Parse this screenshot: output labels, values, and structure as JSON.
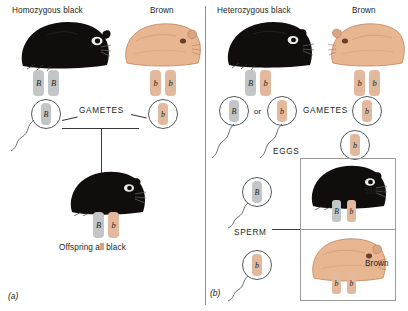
{
  "figure": {
    "panels": [
      {
        "tag": "(a)",
        "name": "homozygous-black-cross",
        "parents": [
          {
            "label": "Homozygous black",
            "phenotype": "black",
            "genotype": "BB",
            "alleles": [
              {
                "symbol": "B",
                "type": "dominant"
              },
              {
                "symbol": "B",
                "type": "dominant"
              }
            ],
            "gametes": [
              {
                "symbol": "B",
                "type": "dominant"
              }
            ]
          },
          {
            "label": "Brown",
            "phenotype": "brown",
            "genotype": "bb",
            "alleles": [
              {
                "symbol": "b",
                "type": "recessive"
              },
              {
                "symbol": "b",
                "type": "recessive"
              }
            ],
            "gametes": [
              {
                "symbol": "b",
                "type": "recessive"
              }
            ]
          }
        ],
        "gametes_label": "GAMETES",
        "offspring": {
          "label": "Offspring all black",
          "phenotype": "black",
          "genotype": "Bb",
          "alleles": [
            {
              "symbol": "B",
              "type": "dominant"
            },
            {
              "symbol": "b",
              "type": "recessive"
            }
          ]
        }
      },
      {
        "tag": "(b)",
        "name": "heterozygous-black-cross",
        "parents": [
          {
            "label": "Heterozygous black",
            "phenotype": "black",
            "genotype": "Bb",
            "alleles": [
              {
                "symbol": "B",
                "type": "dominant"
              },
              {
                "symbol": "b",
                "type": "recessive"
              }
            ],
            "gametes": [
              {
                "symbol": "B",
                "type": "dominant"
              },
              {
                "symbol": "b",
                "type": "recessive"
              }
            ],
            "gamete_conjunction": "or"
          },
          {
            "label": "Brown",
            "phenotype": "brown",
            "genotype": "bb",
            "alleles": [
              {
                "symbol": "b",
                "type": "recessive"
              },
              {
                "symbol": "b",
                "type": "recessive"
              }
            ],
            "gametes": [
              {
                "symbol": "b",
                "type": "recessive"
              }
            ]
          }
        ],
        "gametes_label": "GAMETES",
        "eggs_label": "EGGS",
        "sperm_label": "SPERM",
        "egg": {
          "symbol": "b",
          "type": "recessive"
        },
        "sperm": [
          {
            "symbol": "B",
            "type": "dominant"
          },
          {
            "symbol": "b",
            "type": "recessive"
          }
        ],
        "offspring_rows": [
          {
            "result_label": "Black",
            "phenotype": "black",
            "genotype": "Bb",
            "alleles": [
              {
                "symbol": "B",
                "type": "dominant"
              },
              {
                "symbol": "b",
                "type": "recessive"
              }
            ]
          },
          {
            "result_label": "Brown",
            "phenotype": "brown",
            "genotype": "bb",
            "alleles": [
              {
                "symbol": "b",
                "type": "recessive"
              },
              {
                "symbol": "b",
                "type": "recessive"
              }
            ]
          }
        ]
      }
    ]
  },
  "colors": {
    "dominant_allele_chip": "#c3c6c7",
    "recessive_allele_chip": "#e3b99e",
    "black_coat": "#100d0c",
    "brown_coat": "#e0a77f",
    "line": "#3a3a3a",
    "text": "#231f20",
    "box_border": "#9a9a9a"
  },
  "icons": {
    "black_guinea_pig": "black-guinea-pig-icon",
    "brown_guinea_pig": "brown-guinea-pig-icon",
    "gamete_circle": "gamete-circle-icon",
    "sperm_tail": "sperm-tail-icon"
  }
}
